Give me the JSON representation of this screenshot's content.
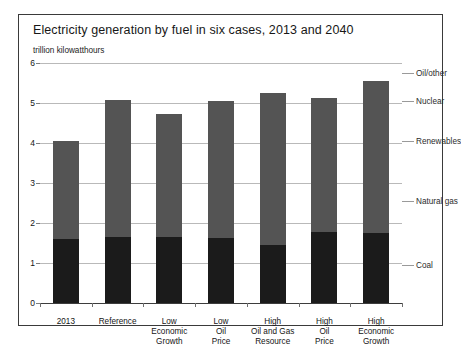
{
  "chart_data": {
    "type": "bar",
    "title": "Electricity generation by fuel in six cases, 2013 and 2040",
    "subtitle": "trillion kilowatthours",
    "xlabel": "",
    "ylabel": "",
    "ylim": [
      0,
      6
    ],
    "ytick_labels": [
      "0",
      "1",
      "2",
      "3",
      "4",
      "5",
      "6"
    ],
    "ytick_values": [
      0,
      1,
      2,
      3,
      4,
      5,
      6
    ],
    "grid": true,
    "legend_position": "right-annotations",
    "categories": [
      "2013",
      "Reference",
      "Low Economic Growth",
      "Low Oil Price",
      "High Oil and Gas Resource",
      "High Oil Price",
      "High Economic Growth"
    ],
    "category_lines": [
      [
        "2013"
      ],
      [
        "Reference"
      ],
      [
        "Low",
        "Economic",
        "Growth"
      ],
      [
        "Low",
        "Oil",
        "Price"
      ],
      [
        "High",
        "Oil and Gas",
        "Resource"
      ],
      [
        "High",
        "Oil",
        "Price"
      ],
      [
        "High",
        "Economic",
        "Growth"
      ]
    ],
    "series": [
      {
        "name": "Coal",
        "color": "#1b1b1b",
        "values": [
          1.6,
          1.65,
          1.65,
          1.62,
          1.45,
          1.78,
          1.75
        ]
      },
      {
        "name": "Other fuels",
        "color": "#545454",
        "values": [
          2.45,
          3.42,
          3.07,
          3.43,
          3.8,
          3.34,
          3.8
        ]
      }
    ],
    "totals": [
      4.05,
      5.07,
      4.72,
      5.05,
      5.25,
      5.12,
      5.55
    ],
    "annotations": [
      {
        "label": "Oil/other",
        "value": 5.75
      },
      {
        "label": "Nuclear",
        "value": 5.05
      },
      {
        "label": "Renewables",
        "value": 4.05
      },
      {
        "label": "Natural gas",
        "value": 2.55
      },
      {
        "label": "Coal",
        "value": 0.95
      }
    ]
  }
}
